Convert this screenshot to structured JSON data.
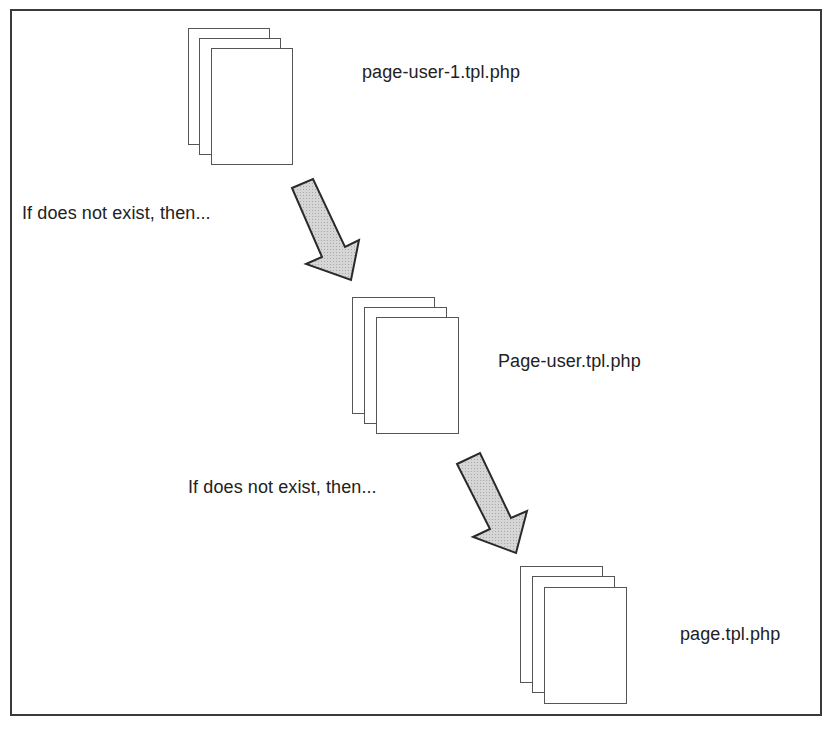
{
  "diagram": {
    "type": "template-fallback-flow",
    "nodes": [
      {
        "id": "n1",
        "label": "page-user-1.tpl.php"
      },
      {
        "id": "n2",
        "label": "Page-user.tpl.php"
      },
      {
        "id": "n3",
        "label": "page.tpl.php"
      }
    ],
    "edges": [
      {
        "from": "n1",
        "to": "n2",
        "label": "If does not exist, then..."
      },
      {
        "from": "n2",
        "to": "n3",
        "label": "If does not exist, then..."
      }
    ]
  },
  "colors": {
    "border": "#3a3a3a",
    "arrow_fill": "#d0d0d0",
    "arrow_stroke": "#2a2a2a",
    "text": "#222222"
  }
}
